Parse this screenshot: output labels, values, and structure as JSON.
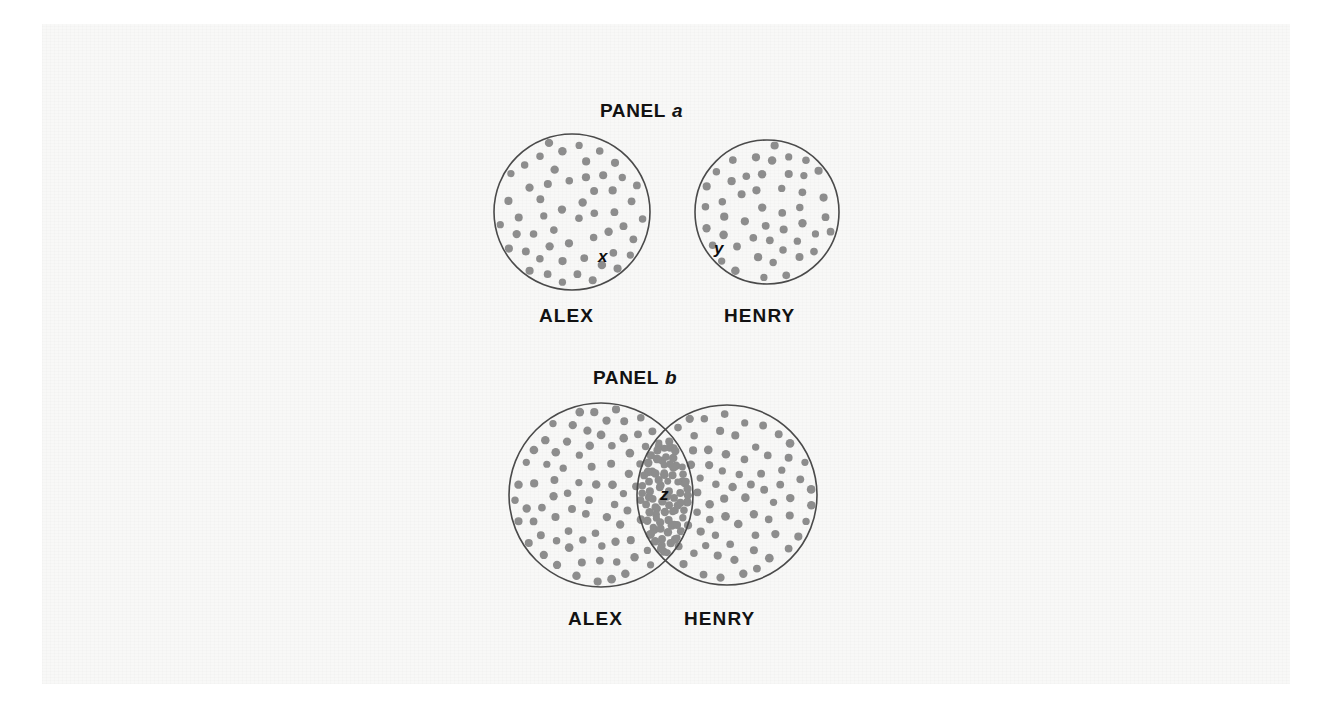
{
  "figure": {
    "background_color": "#ffffff",
    "paper_color": "#f8f8f7",
    "dot_color": "#8d8d8d",
    "outline_color": "#4a4a4a",
    "text_color": "#121212"
  },
  "panels": [
    {
      "id": "panel-a",
      "title_word": "PANEL",
      "title_letter": "a",
      "title_x": 600,
      "title_y": 100,
      "overlap": false,
      "circles": [
        {
          "name": "alex",
          "label": "ALEX",
          "cx": 572,
          "cy": 212,
          "r": 78,
          "label_x": 539,
          "label_y": 305,
          "dot_count": 54
        },
        {
          "name": "henry",
          "label": "HENRY",
          "cx": 767,
          "cy": 212,
          "r": 72,
          "label_x": 724,
          "label_y": 305,
          "dot_count": 48
        }
      ],
      "region_labels": [
        {
          "name": "x",
          "text": "x",
          "x": 598,
          "y": 256
        },
        {
          "name": "y",
          "text": "y",
          "x": 714,
          "y": 248
        }
      ]
    },
    {
      "id": "panel-b",
      "title_word": "PANEL",
      "title_letter": "b",
      "title_x": 593,
      "title_y": 367,
      "overlap": true,
      "circles": [
        {
          "name": "alex",
          "label": "ALEX",
          "cx": 601,
          "cy": 495,
          "r": 92,
          "label_x": 568,
          "label_y": 608,
          "dot_count": 96
        },
        {
          "name": "henry",
          "label": "HENRY",
          "cx": 727,
          "cy": 495,
          "r": 90,
          "label_x": 684,
          "label_y": 608,
          "dot_count": 92
        }
      ],
      "overlap_dot_count": 58,
      "region_labels": [
        {
          "name": "z",
          "text": "z",
          "x": 660,
          "y": 494
        }
      ]
    }
  ],
  "chart_data": {
    "type": "diagram",
    "subtype": "venn",
    "title": "",
    "panels": [
      {
        "label": "PANEL a",
        "description": "Two disjoint (non-overlapping) circles representing separate sets",
        "sets": [
          "ALEX",
          "HENRY"
        ],
        "annotations": [
          "x",
          "y"
        ],
        "set_sizes": [
          54,
          48
        ],
        "intersection_size": 0
      },
      {
        "label": "PANEL b",
        "description": "Two overlapping circles forming a Venn diagram with a shared lens region",
        "sets": [
          "ALEX",
          "HENRY"
        ],
        "annotations": [
          "z"
        ],
        "set_sizes": [
          96,
          92
        ],
        "intersection_size": 58
      }
    ],
    "legend_position": "none",
    "grid": false
  }
}
